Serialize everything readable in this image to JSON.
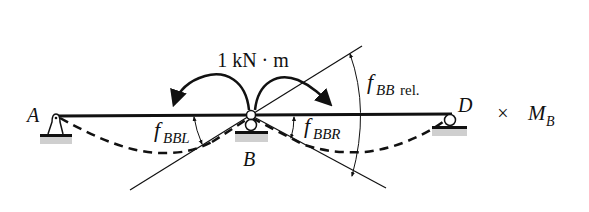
{
  "diagram": {
    "moment_label": "1 kN · m",
    "points": {
      "A": "A",
      "B": "B",
      "D": "D"
    },
    "labels": {
      "f_BBL_main": "f",
      "f_BBL_sub": "BBL",
      "f_BBR_main": "f",
      "f_BBR_sub": "BBR",
      "f_BBrel_main": "f",
      "f_BBrel_sub": "BB",
      "f_BBrel_suffix": "rel.",
      "times": "×",
      "M_B_main": "M",
      "M_B_sub": "B"
    },
    "colors": {
      "ink": "#111111",
      "ground": "#c8c8c8"
    }
  }
}
